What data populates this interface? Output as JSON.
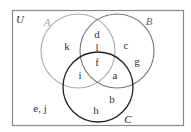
{
  "diagram": {
    "type": "venn",
    "universe": {
      "label": "U"
    },
    "sets": [
      {
        "id": "A",
        "label": "A",
        "color": "#aaaaaa"
      },
      {
        "id": "B",
        "label": "B",
        "color": "#777777"
      },
      {
        "id": "C",
        "label": "C",
        "color": "#222222"
      }
    ],
    "regions": {
      "A_only": "k",
      "B_only_upper": "c",
      "B_only_lower": "g",
      "A_and_B_only_upper": "d",
      "A_and_B_only_lower": "l",
      "A_and_B_and_C": "f",
      "A_and_C_only": "i",
      "B_and_C_only": "a",
      "C_only_right": "b",
      "C_only_left": "h",
      "outside": "e, j"
    }
  }
}
